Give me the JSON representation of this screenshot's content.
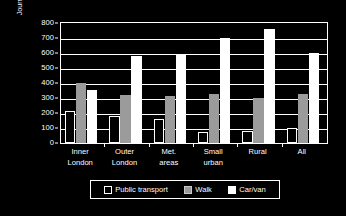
{
  "chart_data": {
    "type": "bar",
    "title": "",
    "subtitle": "",
    "xlabel": "",
    "ylabel": "Journeys per person per year",
    "ylim": [
      0,
      800
    ],
    "ytick_step": 100,
    "yticks": [
      "0",
      "100",
      "200",
      "300",
      "400",
      "500",
      "600",
      "700",
      "800"
    ],
    "grid": true,
    "legend_position": "bottom",
    "categories": [
      "Inner London",
      "Outer London",
      "Met. areas",
      "Small urban",
      "Rural",
      "All"
    ],
    "category_lines": [
      [
        "Inner",
        "London"
      ],
      [
        "Outer",
        "London"
      ],
      [
        "Met.",
        "areas"
      ],
      [
        "Small",
        "urban"
      ],
      [
        "Rural",
        ""
      ],
      [
        "All",
        ""
      ]
    ],
    "series": [
      {
        "name": "Public transport",
        "color": "#000000",
        "border": "#ffffff",
        "values": [
          215,
          180,
          160,
          75,
          78,
          102
        ]
      },
      {
        "name": "Walk",
        "color": "#9b9b9b",
        "border": "#9b9b9b",
        "values": [
          398,
          318,
          315,
          330,
          300,
          325
        ]
      },
      {
        "name": "Car/van",
        "color": "#ffffff",
        "border": "#ffffff",
        "values": [
          352,
          577,
          590,
          700,
          760,
          602
        ]
      }
    ]
  },
  "legend": {
    "items": [
      {
        "label": "Public transport",
        "swatch": "sw-pt"
      },
      {
        "label": "Walk",
        "swatch": "sw-walk"
      },
      {
        "label": "Car/van",
        "swatch": "sw-car"
      }
    ]
  },
  "colors": {
    "background": "#000000",
    "axis": "#ffffff",
    "grid": "#ffffff",
    "text": "#ffffff",
    "walk": "#9b9b9b",
    "car": "#ffffff"
  }
}
